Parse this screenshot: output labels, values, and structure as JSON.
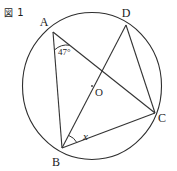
{
  "figure": {
    "caption_mark": "図",
    "caption_number": "1",
    "caption_full": "図 1"
  },
  "colors": {
    "stroke": "#333333",
    "circle_stroke": "#2e2e2e",
    "text": "#1a1a1a",
    "background": "#ffffff"
  },
  "diagram": {
    "type": "circle-geometry",
    "circle": {
      "center_label": "O",
      "center_x": 92,
      "center_y": 86,
      "radius": 70
    },
    "points": [
      {
        "label": "A",
        "x": 53,
        "y": 32,
        "label_x": 44,
        "label_y": 26
      },
      {
        "label": "D",
        "x": 126,
        "y": 25,
        "label_x": 126,
        "label_y": 17
      },
      {
        "label": "C",
        "x": 155,
        "y": 113,
        "label_x": 160,
        "label_y": 122
      },
      {
        "label": "B",
        "x": 62,
        "y": 148,
        "label_x": 55,
        "label_y": 165
      }
    ],
    "segments": [
      {
        "from": "A",
        "to": "B"
      },
      {
        "from": "A",
        "to": "C"
      },
      {
        "from": "B",
        "to": "D"
      },
      {
        "from": "B",
        "to": "C"
      },
      {
        "from": "D",
        "to": "C"
      }
    ],
    "angles": [
      {
        "name": "angle-at-a",
        "vertex": "A",
        "value": "47°",
        "label_x": 58,
        "label_y": 52
      },
      {
        "name": "angle-at-b",
        "vertex": "B",
        "value": "x",
        "label_x": 84,
        "label_y": 139
      }
    ]
  }
}
